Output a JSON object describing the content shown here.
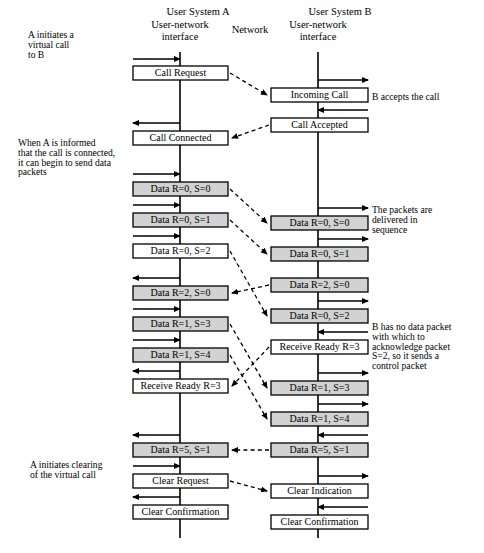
{
  "diagram": {
    "type": "sequence-diagram"
  },
  "headers": {
    "system_a": "User System A",
    "system_b": "User System B",
    "interface_a_line1": "User-network",
    "interface_a_line2": "interface",
    "network": "Network",
    "interface_b_line1": "User-network",
    "interface_b_line2": "interface"
  },
  "annotations": {
    "left": [
      {
        "id": "a-initiates",
        "lines": [
          "A initiates a",
          "virtual call",
          "to B"
        ],
        "x": 28,
        "y": 38
      },
      {
        "id": "when-a-informed",
        "lines": [
          "When A is informed",
          "that the call is connected,",
          "it can begin to send data",
          "packets"
        ],
        "x": 18,
        "y": 146
      },
      {
        "id": "a-initiates-clearing",
        "lines": [
          "A initiates clearing",
          "of the virtual call"
        ],
        "x": 30,
        "y": 468
      }
    ],
    "right": [
      {
        "id": "b-accepts",
        "lines": [
          "B accepts the call"
        ],
        "x": 372,
        "y": 100
      },
      {
        "id": "packets-in-sequence",
        "lines": [
          "The packets are",
          "delivered in",
          "sequence"
        ],
        "x": 372,
        "y": 213
      },
      {
        "id": "b-no-data-packet",
        "lines": [
          "B has no data packet",
          "with which to",
          "acknowledge packet",
          "S=2, so it sends a",
          "control packet"
        ],
        "x": 372,
        "y": 330
      }
    ]
  },
  "colors": {
    "shaded_fill": "#d2d2d2",
    "plain_fill": "#ffffff",
    "stroke": "#000000",
    "page_background": "#ffffff"
  },
  "lifelines": {
    "left_x": 180,
    "right_x": 318,
    "top_y": 52,
    "bottom_y": 538
  },
  "left_column": {
    "x": 133,
    "width": 95,
    "boxes": [
      {
        "id": "call-request",
        "label": "Call Request",
        "y": 66,
        "shaded": false,
        "arrow": "right",
        "arrow_y": 59
      },
      {
        "id": "call-connected",
        "label": "Call Connected",
        "y": 131,
        "shaded": false,
        "arrow": "left",
        "arrow_y": 123
      },
      {
        "id": "data-r0-s0-a",
        "label": "Data R=0, S=0",
        "y": 182,
        "shaded": true,
        "arrow": "right",
        "arrow_y": 174
      },
      {
        "id": "data-r0-s1-a",
        "label": "Data R=0, S=1",
        "y": 213,
        "shaded": true,
        "arrow": "right",
        "arrow_y": 205
      },
      {
        "id": "data-r0-s2-a",
        "label": "Data R=0, S=2",
        "y": 244,
        "shaded": false,
        "arrow": "right",
        "arrow_y": 236
      },
      {
        "id": "data-r2-s0-a",
        "label": "Data R=2, S=0",
        "y": 286,
        "shaded": true,
        "arrow": "left",
        "arrow_y": 278
      },
      {
        "id": "data-r1-s3-a",
        "label": "Data R=1, S=3",
        "y": 317,
        "shaded": true,
        "arrow": "right",
        "arrow_y": 309
      },
      {
        "id": "data-r1-s4-a",
        "label": "Data R=1, S=4",
        "y": 348,
        "shaded": true,
        "arrow": "right",
        "arrow_y": 340
      },
      {
        "id": "receive-ready-r3-a",
        "label": "Receive Ready R=3",
        "y": 379,
        "shaded": false,
        "arrow": "left",
        "arrow_y": 371
      },
      {
        "id": "data-r5-s1-a",
        "label": "Data R=5, S=1",
        "y": 443,
        "shaded": true,
        "arrow": "left",
        "arrow_y": 435
      },
      {
        "id": "clear-request",
        "label": "Clear Request",
        "y": 474,
        "shaded": false,
        "arrow": "right",
        "arrow_y": 466
      },
      {
        "id": "clear-confirmation-a",
        "label": "Clear Confirmation",
        "y": 505,
        "shaded": false,
        "arrow": "left",
        "arrow_y": 497
      }
    ]
  },
  "right_column": {
    "x": 271,
    "width": 97,
    "boxes": [
      {
        "id": "incoming-call",
        "label": "Incoming Call",
        "y": 88,
        "shaded": false,
        "arrow": "right",
        "arrow_y": 80
      },
      {
        "id": "call-accepted",
        "label": "Call Accepted",
        "y": 118,
        "shaded": false,
        "arrow": "left",
        "arrow_y": 110
      },
      {
        "id": "data-r0-s0-b",
        "label": "Data R=0, S=0",
        "y": 216,
        "shaded": true,
        "arrow": "right",
        "arrow_y": 208
      },
      {
        "id": "data-r0-s1-b",
        "label": "Data R=0, S=1",
        "y": 247,
        "shaded": true,
        "arrow": "right",
        "arrow_y": 239
      },
      {
        "id": "data-r2-s0-b",
        "label": "Data R=2, S=0",
        "y": 278,
        "shaded": true,
        "arrow": "none",
        "arrow_y": 0
      },
      {
        "id": "data-r0-s2-b",
        "label": "Data R=0, S=2",
        "y": 309,
        "shaded": true,
        "arrow": "right",
        "arrow_y": 301
      },
      {
        "id": "receive-ready-r3-b",
        "label": "Receive Ready R=3",
        "y": 340,
        "shaded": false,
        "arrow": "left",
        "arrow_y": 332
      },
      {
        "id": "data-r1-s3-b",
        "label": "Data R=1, S=3",
        "y": 381,
        "shaded": true,
        "arrow": "right",
        "arrow_y": 373
      },
      {
        "id": "data-r1-s4-b",
        "label": "Data R=1, S=4",
        "y": 412,
        "shaded": true,
        "arrow": "right",
        "arrow_y": 404
      },
      {
        "id": "data-r5-s1-b",
        "label": "Data R=5, S=1",
        "y": 443,
        "shaded": true,
        "arrow": "left",
        "arrow_y": 435
      },
      {
        "id": "clear-indication",
        "label": "Clear Indication",
        "y": 484,
        "shaded": false,
        "arrow": "right",
        "arrow_y": 476
      },
      {
        "id": "clear-confirmation-b",
        "label": "Clear Confirmation",
        "y": 515,
        "shaded": false,
        "arrow": "left",
        "arrow_y": 507
      }
    ]
  },
  "connectors": [
    {
      "id": "c-call-request",
      "from": "call-request",
      "to": "incoming-call",
      "direction": "a-to-b"
    },
    {
      "id": "c-call-accepted",
      "from": "call-accepted",
      "to": "call-connected",
      "direction": "b-to-a"
    },
    {
      "id": "c-d00",
      "from": "data-r0-s0-a",
      "to": "data-r0-s0-b",
      "direction": "a-to-b"
    },
    {
      "id": "c-d01",
      "from": "data-r0-s1-a",
      "to": "data-r0-s1-b",
      "direction": "a-to-b"
    },
    {
      "id": "c-d02",
      "from": "data-r0-s2-a",
      "to": "data-r0-s2-b",
      "direction": "a-to-b"
    },
    {
      "id": "c-d20",
      "from": "data-r2-s0-b",
      "to": "data-r2-s0-a",
      "direction": "b-to-a"
    },
    {
      "id": "c-d13",
      "from": "data-r1-s3-a",
      "to": "data-r1-s3-b",
      "direction": "a-to-b"
    },
    {
      "id": "c-d14",
      "from": "data-r1-s4-a",
      "to": "data-r1-s4-b",
      "direction": "a-to-b"
    },
    {
      "id": "c-rr3",
      "from": "receive-ready-r3-b",
      "to": "receive-ready-r3-a",
      "direction": "b-to-a"
    },
    {
      "id": "c-d51",
      "from": "data-r5-s1-b",
      "to": "data-r5-s1-a",
      "direction": "b-to-a"
    },
    {
      "id": "c-clear",
      "from": "clear-request",
      "to": "clear-indication",
      "direction": "a-to-b"
    }
  ]
}
